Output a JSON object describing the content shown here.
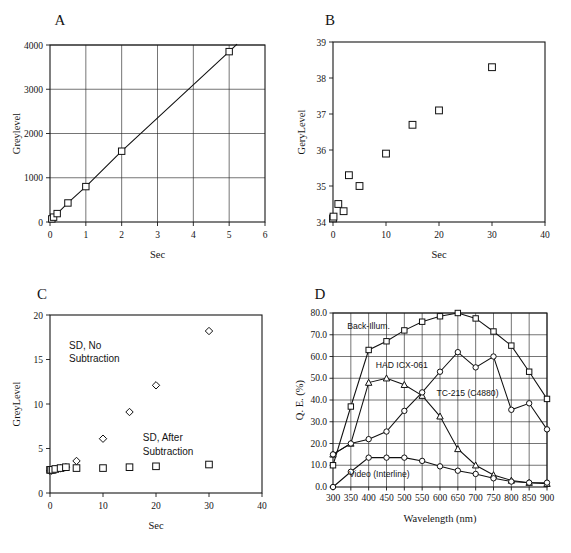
{
  "figure": {
    "panels": [
      "A",
      "B",
      "C",
      "D"
    ]
  },
  "panelA": {
    "label": "A",
    "xlabel": "Sec",
    "ylabel": "Greylevel",
    "xticks": [
      "0",
      "1",
      "2",
      "3",
      "4",
      "5",
      "6"
    ],
    "yticks": [
      "0",
      "1000",
      "2000",
      "3000",
      "4000"
    ]
  },
  "panelB": {
    "label": "B",
    "xlabel": "Sec",
    "ylabel": "GeryLevel",
    "xticks": [
      "0",
      "10",
      "20",
      "30",
      "40"
    ],
    "yticks": [
      "34",
      "35",
      "36",
      "37",
      "38",
      "39"
    ]
  },
  "panelC": {
    "label": "C",
    "xlabel": "Sec",
    "ylabel": "GreyLevel",
    "xticks": [
      "0",
      "10",
      "20",
      "30",
      "40"
    ],
    "yticks": [
      "0",
      "5",
      "10",
      "15",
      "20"
    ],
    "annotation_no_subtraction": [
      "SD, No",
      "Subtraction"
    ],
    "annotation_after_subtraction": [
      "SD, After",
      "Subtraction"
    ]
  },
  "panelD": {
    "label": "D",
    "xlabel": "Wavelength (nm)",
    "ylabel": "Q. E. (%)",
    "xticks": [
      "300",
      "350",
      "400",
      "450",
      "500",
      "550",
      "600",
      "650",
      "700",
      "750",
      "800",
      "850",
      "900"
    ],
    "yticks": [
      "0.0",
      "10.0",
      "20.0",
      "30.0",
      "40.0",
      "50.0",
      "60.0",
      "70.0",
      "80.0"
    ],
    "curve_labels": {
      "back_illum": "Back-Illum.",
      "had": "HAD ICX-061",
      "tc215": "TC-215  (C4880)",
      "video": "Video  (Interline)"
    }
  },
  "chart_data": [
    {
      "type": "line",
      "panel": "A",
      "title": "A",
      "xlabel": "Sec",
      "ylabel": "Greylevel",
      "xlim": [
        0,
        6
      ],
      "ylim": [
        0,
        4000
      ],
      "grid": true,
      "marker": "square",
      "x": [
        0.05,
        0.1,
        0.2,
        0.5,
        1,
        2,
        5
      ],
      "values": [
        70,
        110,
        190,
        430,
        800,
        1600,
        3850
      ]
    },
    {
      "type": "scatter",
      "panel": "B",
      "title": "B",
      "xlabel": "Sec",
      "ylabel": "GeryLevel",
      "xlim": [
        0,
        40
      ],
      "ylim": [
        34,
        39
      ],
      "grid": false,
      "marker": "square",
      "x": [
        0,
        0.1,
        1,
        2,
        3,
        5,
        10,
        15,
        20,
        30
      ],
      "values": [
        34.1,
        34.15,
        34.5,
        34.3,
        35.3,
        35.0,
        35.9,
        36.7,
        37.1,
        38.3
      ]
    },
    {
      "type": "scatter",
      "panel": "C",
      "title": "C",
      "xlabel": "Sec",
      "ylabel": "GreyLevel",
      "xlim": [
        0,
        40
      ],
      "ylim": [
        0,
        20
      ],
      "grid": false,
      "series": [
        {
          "name": "SD, No Subtraction",
          "marker": "diamond",
          "x": [
            0,
            0.2,
            0.5,
            1,
            2,
            3,
            5,
            10,
            15,
            20,
            30
          ],
          "values": [
            2.5,
            2.5,
            2.6,
            2.7,
            2.8,
            2.9,
            3.6,
            6.1,
            9.1,
            12.1,
            18.2
          ]
        },
        {
          "name": "SD, After Subtraction",
          "marker": "square",
          "x": [
            0,
            0.2,
            0.5,
            1,
            2,
            3,
            5,
            10,
            15,
            20,
            30
          ],
          "values": [
            2.6,
            2.6,
            2.6,
            2.7,
            2.8,
            2.9,
            2.8,
            2.8,
            2.9,
            3.0,
            3.2
          ]
        }
      ]
    },
    {
      "type": "line",
      "panel": "D",
      "title": "D",
      "xlabel": "Wavelength (nm)",
      "ylabel": "Q. E. (%)",
      "xlim": [
        300,
        900
      ],
      "ylim": [
        0,
        80
      ],
      "grid": true,
      "x": [
        300,
        350,
        400,
        450,
        500,
        550,
        600,
        650,
        700,
        750,
        800,
        850,
        900
      ],
      "series": [
        {
          "name": "Back-Illum.",
          "marker": "square",
          "values": [
            10.0,
            37.0,
            63.0,
            67.0,
            72.0,
            76.0,
            78.5,
            80.0,
            77.5,
            71.5,
            65.0,
            53.0,
            40.5
          ]
        },
        {
          "name": "HAD ICX-061",
          "marker": "triangle",
          "values": [
            15.0,
            20.0,
            48.0,
            50.0,
            47.0,
            42.0,
            32.5,
            17.5,
            10.0,
            5.5,
            3.0,
            2.0,
            1.5
          ]
        },
        {
          "name": "TC-215  (C4880)",
          "marker": "circle",
          "values": [
            15.0,
            20.0,
            22.0,
            25.5,
            35.0,
            43.5,
            53.0,
            62.0,
            55.0,
            60.0,
            35.5,
            38.5,
            26.5
          ]
        },
        {
          "name": "Video  (Interline)",
          "marker": "circle",
          "values": [
            0.0,
            7.0,
            13.5,
            13.5,
            13.5,
            12.0,
            9.5,
            7.5,
            6.0,
            4.0,
            2.5,
            2.0,
            2.0
          ]
        }
      ]
    }
  ]
}
